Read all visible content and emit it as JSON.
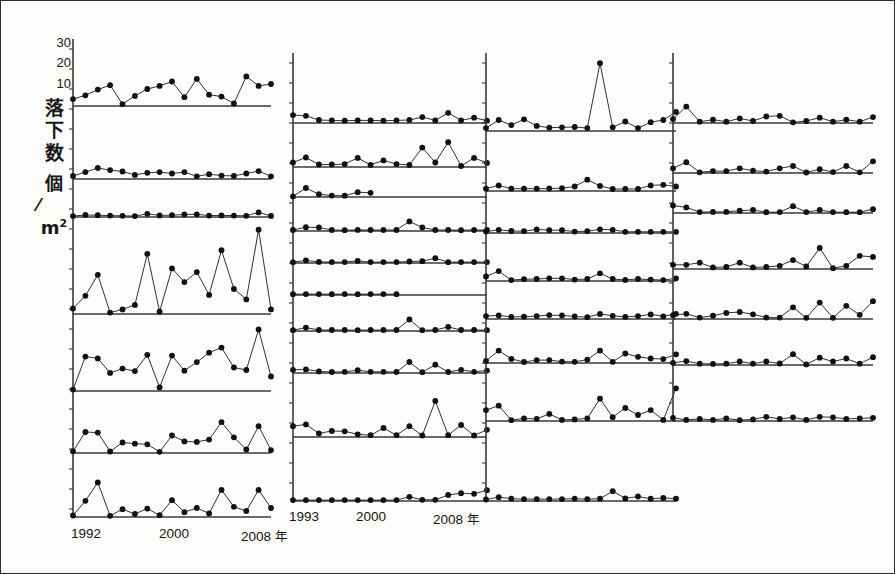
{
  "figure": {
    "background": "#fdfdfb",
    "ink": "#1a1a1a",
    "marker_color": "#111111",
    "axis_color": "#3a3a3a"
  },
  "yaxis": {
    "label_chars": [
      "落",
      "下",
      "数"
    ],
    "unit_top": "個",
    "unit_slash": "／",
    "unit_bottom": "m",
    "unit_exp": "2",
    "ticks": [
      {
        "value": 30,
        "label": "30"
      },
      {
        "value": 20,
        "label": "20"
      },
      {
        "value": 10,
        "label": "10"
      }
    ],
    "ymin": 0,
    "ymax": 33
  },
  "xaxis": {
    "columns": [
      {
        "start_label": "1992",
        "mid_label": "2000",
        "end_label": "2008",
        "year_char": "年"
      },
      {
        "start_label": "1993",
        "mid_label": "2000",
        "end_label": "2008",
        "year_char": "年"
      }
    ]
  },
  "chart_data": {
    "type": "line",
    "title": "",
    "xlabel": "年",
    "ylabel": "落下数 個/m2",
    "ylim": [
      0,
      33
    ],
    "grid": false,
    "legend": "none",
    "marker": "filled-circle",
    "note": "Small-multiple stacked time-series panels; each panel shares the same y-scale (0-30 seeds per square metre) and x-range of years.",
    "panel_columns": [
      {
        "column_index": 1,
        "x": [
          1992,
          1993,
          1994,
          1995,
          1996,
          1997,
          1998,
          1999,
          2000,
          2001,
          2002,
          2003,
          2004,
          2005,
          2006,
          2007,
          2008
        ],
        "panels": [
          {
            "panel_index": 1,
            "values": [
              2.2,
              3.4,
              5.2,
              6.6,
              0.6,
              3.2,
              5.4,
              6.4,
              7.8,
              2.8,
              8.6,
              3.6,
              3.0,
              0.8,
              9.4,
              6.4,
              7.0
            ]
          },
          {
            "panel_index": 2,
            "values": [
              0.9,
              2.0,
              3.2,
              2.6,
              2.2,
              1.2,
              1.8,
              2.0,
              1.6,
              2.0,
              0.8,
              1.4,
              1.0,
              0.9,
              1.6,
              2.3,
              0.8
            ]
          },
          {
            "panel_index": 3,
            "values": [
              0.5,
              1.1,
              1.0,
              0.8,
              0.7,
              0.5,
              1.8,
              0.9,
              1.0,
              1.4,
              1.5,
              0.8,
              0.9,
              0.8,
              0.7,
              2.6,
              0.6
            ]
          },
          {
            "panel_index": 4,
            "values": [
              1.2,
              4.0,
              8.6,
              0.3,
              1.0,
              2.0,
              13.2,
              0.5,
              10.0,
              7.0,
              9.2,
              4.2,
              14.0,
              5.5,
              3.2,
              18.5,
              1.0
            ]
          },
          {
            "panel_index": 5,
            "values": [
              0.4,
              9.5,
              9.0,
              5.0,
              6.2,
              5.5,
              10.0,
              1.0,
              9.8,
              5.6,
              8.0,
              10.6,
              12.0,
              6.5,
              5.8,
              17.0,
              4.0
            ]
          },
          {
            "panel_index": 6,
            "values": [
              0.6,
              7.2,
              7.0,
              0.5,
              3.6,
              3.2,
              3.0,
              0.4,
              6.0,
              4.0,
              3.8,
              4.6,
              10.6,
              5.4,
              1.2,
              9.2,
              1.0
            ]
          },
          {
            "panel_index": 7,
            "values": [
              0.5,
              5.4,
              11.5,
              0.4,
              2.6,
              1.0,
              2.8,
              0.6,
              5.6,
              1.6,
              3.0,
              1.2,
              9.0,
              3.4,
              2.0,
              9.0,
              3.0
            ]
          }
        ]
      },
      {
        "column_index": 2,
        "x": [
          1993,
          1994,
          1995,
          1996,
          1997,
          1998,
          1999,
          2000,
          2001,
          2002,
          2003,
          2004,
          2005,
          2006,
          2007,
          2008
        ],
        "panels": [
          {
            "panel_index": 1,
            "values": [
              2.4,
              2.2,
              0.9,
              0.8,
              0.7,
              0.8,
              0.8,
              0.7,
              0.8,
              0.9,
              1.8,
              0.8,
              3.1,
              0.8,
              1.6,
              0.7
            ]
          },
          {
            "panel_index": 2,
            "values": [
              2.2,
              4.6,
              1.2,
              1.2,
              1.4,
              4.4,
              1.0,
              3.2,
              1.4,
              1.0,
              9.4,
              2.2,
              12.0,
              0.5,
              4.4,
              2.0
            ]
          },
          {
            "panel_index": 3,
            "values": [
              0.4,
              6.4,
              2.0,
              1.0,
              0.9,
              3.4,
              3.0,
              null,
              null,
              null,
              null,
              null,
              null,
              null,
              null,
              null
            ]
          },
          {
            "panel_index": 4,
            "values": [
              0.6,
              2.4,
              2.2,
              0.6,
              0.5,
              0.7,
              0.6,
              0.6,
              0.6,
              6.0,
              2.2,
              0.6,
              0.6,
              0.5,
              0.6,
              0.6
            ]
          },
          {
            "panel_index": 5,
            "values": [
              0.5,
              1.7,
              0.7,
              0.6,
              0.6,
              1.4,
              0.6,
              0.6,
              0.6,
              1.0,
              1.2,
              3.2,
              0.5,
              0.6,
              0.6,
              0.6
            ]
          },
          {
            "panel_index": 6,
            "values": [
              0.5,
              0.6,
              0.6,
              0.5,
              0.6,
              0.5,
              0.6,
              0.6,
              0.5,
              null,
              null,
              null,
              null,
              null,
              null,
              null
            ]
          },
          {
            "panel_index": 7,
            "values": [
              0.5,
              2.0,
              0.6,
              0.6,
              0.6,
              0.5,
              0.6,
              0.6,
              0.6,
              6.8,
              0.5,
              0.6,
              2.4,
              0.6,
              0.6,
              0.5
            ]
          },
          {
            "panel_index": 8,
            "values": [
              1.6,
              1.8,
              0.8,
              0.5,
              0.6,
              1.4,
              0.6,
              0.6,
              0.5,
              5.6,
              0.4,
              4.2,
              0.5,
              1.6,
              0.6,
              1.2
            ]
          },
          {
            "panel_index": 9,
            "values": [
              3.6,
              4.2,
              1.2,
              2.0,
              1.9,
              0.9,
              0.6,
              3.0,
              0.6,
              3.6,
              0.5,
              12.0,
              0.6,
              4.0,
              0.5,
              2.4
            ]
          },
          {
            "panel_index": 10,
            "values": [
              0.3,
              0.3,
              0.3,
              0.3,
              0.3,
              0.3,
              0.3,
              0.3,
              0.3,
              1.4,
              0.4,
              0.4,
              2.0,
              2.6,
              2.4,
              3.6
            ]
          }
        ]
      },
      {
        "column_index": 3,
        "x": [
          1993,
          1994,
          1995,
          1996,
          1997,
          1998,
          1999,
          2000,
          2001,
          2002,
          2003,
          2004,
          2005,
          2006,
          2007,
          2008
        ],
        "panels": [
          {
            "panel_index": 1,
            "values": [
              0.8,
              3.0,
              1.6,
              3.2,
              1.4,
              0.9,
              1.0,
              1.1,
              0.8,
              18.5,
              1.0,
              2.6,
              0.8,
              2.4,
              3.0,
              5.2
            ]
          },
          {
            "panel_index": 2,
            "values": [
              0.8,
              2.0,
              0.8,
              0.8,
              0.8,
              0.9,
              1.0,
              1.6,
              4.0,
              1.8,
              0.7,
              0.7,
              0.7,
              2.0,
              2.2,
              1.6
            ]
          },
          {
            "panel_index": 3,
            "values": [
              0.7,
              1.6,
              1.0,
              0.9,
              1.8,
              1.4,
              1.4,
              0.7,
              0.9,
              1.9,
              1.6,
              0.6,
              0.6,
              0.6,
              0.6,
              0.6
            ]
          },
          {
            "panel_index": 4,
            "values": [
              2.0,
              4.4,
              0.4,
              0.8,
              0.9,
              1.2,
              1.2,
              0.6,
              0.9,
              3.4,
              0.9,
              0.5,
              0.9,
              0.6,
              0.4,
              1.2
            ]
          },
          {
            "panel_index": 5,
            "values": [
              1.6,
              2.0,
              1.2,
              1.3,
              1.6,
              2.2,
              2.0,
              1.4,
              1.0,
              2.8,
              1.8,
              1.2,
              1.6,
              2.6,
              1.5,
              2.9
            ]
          },
          {
            "panel_index": 6,
            "values": [
              1.0,
              6.0,
              2.0,
              0.5,
              1.4,
              1.4,
              0.7,
              0.6,
              1.6,
              6.0,
              0.6,
              4.6,
              3.0,
              2.2,
              1.9,
              4.2
            ]
          },
          {
            "panel_index": 7,
            "values": [
              4.0,
              5.6,
              0.3,
              0.9,
              0.8,
              2.6,
              0.4,
              0.6,
              1.0,
              8.2,
              1.4,
              4.8,
              2.2,
              4.0,
              0.4,
              12.0
            ]
          },
          {
            "panel_index": 8,
            "values": [
              0.4,
              1.0,
              0.6,
              0.5,
              0.5,
              0.5,
              0.5,
              0.6,
              0.5,
              0.6,
              2.6,
              0.7,
              1.2,
              0.6,
              0.8,
              0.6
            ]
          }
        ]
      },
      {
        "column_index": 4,
        "x": [
          1993,
          1994,
          1995,
          1996,
          1997,
          1998,
          1999,
          2000,
          2001,
          2002,
          2003,
          2004,
          2005,
          2006,
          2007,
          2008
        ],
        "panels": [
          {
            "panel_index": 1,
            "values": [
              1.2,
              5.0,
              0.4,
              1.0,
              0.4,
              1.4,
              0.6,
              2.0,
              2.2,
              0.2,
              0.6,
              1.6,
              0.4,
              1.0,
              0.4,
              1.8
            ]
          },
          {
            "panel_index": 2,
            "values": [
              2.0,
              4.6,
              0.3,
              0.8,
              0.8,
              2.0,
              1.0,
              0.6,
              2.0,
              3.0,
              0.2,
              1.6,
              0.4,
              3.0,
              0.3,
              5.0
            ]
          },
          {
            "panel_index": 3,
            "values": [
              4.0,
              3.0,
              0.5,
              0.6,
              0.6,
              1.2,
              1.6,
              0.4,
              0.5,
              3.6,
              0.5,
              1.6,
              0.5,
              0.4,
              0.4,
              2.0
            ]
          },
          {
            "panel_index": 4,
            "values": [
              1.6,
              1.6,
              2.4,
              0.6,
              0.8,
              2.4,
              0.6,
              0.8,
              1.2,
              3.4,
              1.0,
              8.0,
              0.3,
              1.2,
              5.0,
              4.6
            ]
          },
          {
            "panel_index": 5,
            "values": [
              1.6,
              2.2,
              0.6,
              1.4,
              2.6,
              3.0,
              2.0,
              0.6,
              0.6,
              5.0,
              0.5,
              7.0,
              0.5,
              5.6,
              1.8,
              7.6
            ]
          },
          {
            "panel_index": 6,
            "values": [
              1.0,
              1.8,
              0.6,
              0.5,
              0.6,
              1.6,
              0.6,
              1.6,
              0.7,
              5.0,
              0.3,
              3.4,
              1.6,
              3.0,
              0.6,
              3.6
            ]
          },
          {
            "panel_index": 7,
            "values": [
              1.2,
              0.4,
              0.8,
              0.4,
              1.0,
              0.3,
              0.6,
              1.6,
              0.8,
              1.4,
              0.4,
              1.6,
              1.4,
              0.8,
              1.0,
              1.2
            ]
          }
        ]
      }
    ]
  }
}
